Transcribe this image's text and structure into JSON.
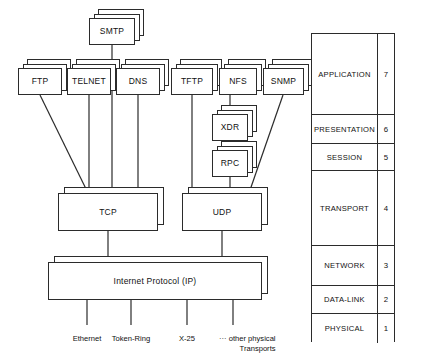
{
  "application_protocols": [
    {
      "id": "smtp",
      "label": "SMTP",
      "x": 89,
      "y": 18,
      "w": 46,
      "h": 27
    },
    {
      "id": "ftp",
      "label": "FTP",
      "x": 18,
      "y": 68,
      "w": 44,
      "h": 27
    },
    {
      "id": "telnet",
      "label": "TELNET",
      "x": 67,
      "y": 68,
      "w": 44,
      "h": 27
    },
    {
      "id": "dns",
      "label": "DNS",
      "x": 116,
      "y": 68,
      "w": 44,
      "h": 27
    },
    {
      "id": "tftp",
      "label": "TFTP",
      "x": 171,
      "y": 68,
      "w": 42,
      "h": 27
    },
    {
      "id": "nfs",
      "label": "NFS",
      "x": 219,
      "y": 68,
      "w": 38,
      "h": 27
    },
    {
      "id": "snmp",
      "label": "SNMP",
      "x": 263,
      "y": 68,
      "w": 41,
      "h": 27
    }
  ],
  "middleware": [
    {
      "id": "xdr",
      "label": "XDR",
      "x": 212,
      "y": 114,
      "w": 36,
      "h": 27
    },
    {
      "id": "rpc",
      "label": "RPC",
      "x": 212,
      "y": 150,
      "w": 36,
      "h": 27
    }
  ],
  "transport_layer": [
    {
      "id": "tcp",
      "label": "TCP",
      "x": 58,
      "y": 193,
      "w": 100,
      "h": 38
    },
    {
      "id": "udp",
      "label": "UDP",
      "x": 182,
      "y": 193,
      "w": 80,
      "h": 38
    }
  ],
  "internet_layer": {
    "id": "ip",
    "label": "Internet Protocol (IP)",
    "x": 48,
    "y": 262,
    "w": 214,
    "h": 38
  },
  "physical_transports": [
    {
      "id": "ethernet",
      "label": "Ethernet",
      "tick_x": 87,
      "text_x": 87,
      "text_y": 334,
      "align": "center"
    },
    {
      "id": "token-ring",
      "label": "Token-Ring",
      "tick_x": 131,
      "text_x": 131,
      "text_y": 334,
      "align": "center"
    },
    {
      "id": "x25",
      "label": "X-25",
      "tick_x": 187,
      "text_x": 187,
      "text_y": 334,
      "align": "center"
    },
    {
      "id": "other",
      "label": "··· other physical",
      "label2": "Transports",
      "tick_x": 233,
      "text_x": 219,
      "text_y": 334,
      "align": "left"
    }
  ],
  "osi_model": {
    "layers": [
      {
        "name": "APPLICATION",
        "number": "7",
        "height": 81
      },
      {
        "name": "PRESENTATION",
        "number": "6",
        "height": 29
      },
      {
        "name": "SESSION",
        "number": "5",
        "height": 27
      },
      {
        "name": "TRANSPORT",
        "number": "4",
        "height": 75
      },
      {
        "name": "NETWORK",
        "number": "3",
        "height": 40
      },
      {
        "name": "DATA-LINK",
        "number": "2",
        "height": 28
      },
      {
        "name": "PHYSICAL",
        "number": "1",
        "height": 29
      }
    ]
  },
  "connections": [
    {
      "from": "ftp",
      "to": "tcp",
      "type": "diagonal"
    },
    {
      "from": "telnet",
      "to": "tcp",
      "type": "vertical"
    },
    {
      "from": "smtp",
      "to": "tcp",
      "type": "vertical"
    },
    {
      "from": "dns",
      "to": "tcp",
      "type": "vertical"
    },
    {
      "from": "tftp",
      "to": "udp",
      "type": "vertical"
    },
    {
      "from": "nfs",
      "to": "xdr",
      "type": "vertical"
    },
    {
      "from": "xdr",
      "to": "rpc",
      "type": "vertical"
    },
    {
      "from": "rpc",
      "to": "udp",
      "type": "vertical"
    },
    {
      "from": "snmp",
      "to": "udp",
      "type": "diagonal"
    },
    {
      "from": "tcp",
      "to": "ip",
      "type": "vertical"
    },
    {
      "from": "udp",
      "to": "ip",
      "type": "vertical"
    }
  ],
  "colors": {
    "stroke": "#2b2b2b",
    "fill": "#ffffff",
    "text": "#111111"
  }
}
